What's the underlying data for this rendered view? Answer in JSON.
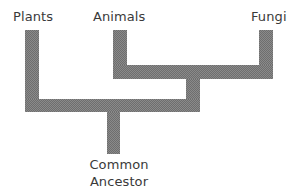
{
  "diagram": {
    "type": "phylogenetic-tree",
    "leaves": [
      {
        "label": "Plants"
      },
      {
        "label": "Animals"
      },
      {
        "label": "Fungi"
      }
    ],
    "root": {
      "line1": "Common",
      "line2": "Ancestor"
    },
    "structure": "((Animals, Fungi), Plants) -> Common Ancestor",
    "colors": {
      "branch": "#8a8a8a",
      "text": "#3a3a3a",
      "background": "#ffffff"
    }
  }
}
